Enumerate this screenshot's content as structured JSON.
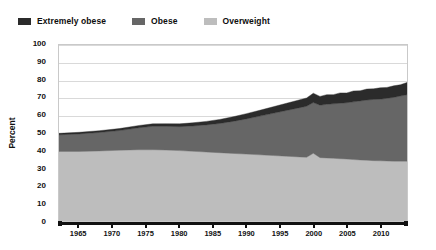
{
  "legend": {
    "position": "top-left",
    "items": [
      {
        "label": "Extremely obese",
        "color": "#2b2b2b",
        "key": "extremely_obese"
      },
      {
        "label": "Obese",
        "color": "#666666",
        "key": "obese"
      },
      {
        "label": "Overweight",
        "color": "#bdbdbd",
        "key": "overweight"
      }
    ]
  },
  "axes": {
    "y": {
      "title": "Percent",
      "ticks": [
        0,
        10,
        20,
        30,
        40,
        50,
        60,
        70,
        80,
        90,
        100
      ],
      "min": 0,
      "max": 100
    },
    "x": {
      "title": "",
      "ticks": [
        1965,
        1970,
        1975,
        1980,
        1985,
        1990,
        1995,
        2000,
        2005,
        2010
      ],
      "min": 1962,
      "max": 2014
    }
  },
  "chart_data": {
    "type": "area",
    "stacked": true,
    "title": "",
    "subtitle": "",
    "xlabel": "",
    "ylabel": "Percent",
    "xlim": [
      1962,
      2014
    ],
    "ylim": [
      0,
      100
    ],
    "grid": true,
    "legend_position": "top-left",
    "x": [
      1962,
      1965,
      1968,
      1971,
      1974,
      1976,
      1978,
      1980,
      1982,
      1984,
      1986,
      1988,
      1990,
      1992,
      1994,
      1996,
      1998,
      1999,
      2000,
      2001,
      2002,
      2003,
      2004,
      2005,
      2006,
      2007,
      2008,
      2009,
      2010,
      2011,
      2012,
      2013,
      2014
    ],
    "series": [
      {
        "name": "Overweight",
        "key": "overweight",
        "color": "#bdbdbd",
        "values": [
          39.5,
          39.5,
          39.8,
          40.2,
          40.5,
          40.5,
          40.3,
          40.0,
          39.6,
          39.2,
          38.8,
          38.4,
          38.0,
          37.6,
          37.2,
          36.8,
          36.4,
          36.2,
          38.5,
          36.0,
          35.8,
          35.6,
          35.4,
          35.2,
          34.9,
          34.7,
          34.5,
          34.3,
          34.2,
          34.1,
          34.0,
          34.0,
          34.0
        ]
      },
      {
        "name": "Obese",
        "key": "obese",
        "color": "#666666",
        "values": [
          9.5,
          10.0,
          10.5,
          11.2,
          12.5,
          13.3,
          13.5,
          13.6,
          14.4,
          15.4,
          16.6,
          18.2,
          20.0,
          22.0,
          24.0,
          26.0,
          28.0,
          29.0,
          28.8,
          29.8,
          30.5,
          31.0,
          31.5,
          32.0,
          32.8,
          33.5,
          34.2,
          34.8,
          35.0,
          35.6,
          36.2,
          37.0,
          37.7
        ]
      },
      {
        "name": "Extremely obese",
        "key": "extremely_obese",
        "color": "#2b2b2b",
        "values": [
          0.8,
          0.9,
          1.0,
          1.1,
          1.3,
          1.4,
          1.5,
          1.6,
          1.8,
          2.0,
          2.3,
          2.6,
          3.0,
          3.3,
          3.7,
          4.1,
          4.5,
          4.7,
          5.3,
          5.0,
          5.5,
          5.2,
          5.9,
          5.6,
          6.2,
          5.8,
          6.3,
          6.0,
          6.5,
          6.2,
          6.6,
          6.4,
          7.0
        ]
      }
    ],
    "totals": [
      49.8,
      50.4,
      51.3,
      52.5,
      54.3,
      55.2,
      55.3,
      55.2,
      55.8,
      56.6,
      57.7,
      59.2,
      61.0,
      62.9,
      64.9,
      66.9,
      68.9,
      69.9,
      72.6,
      70.8,
      71.8,
      71.8,
      72.8,
      72.8,
      73.9,
      74.0,
      75.0,
      75.1,
      75.7,
      75.9,
      76.8,
      77.4,
      78.7
    ]
  }
}
